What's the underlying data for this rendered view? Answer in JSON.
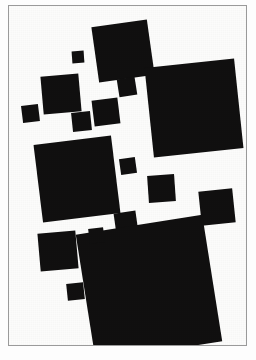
{
  "page": {
    "width": 256,
    "height": 360,
    "background_color": "#ffffff",
    "kind": "artwork-reproduction-plate"
  },
  "frame": {
    "border_color": "#9a9a9a",
    "border_width_px": 1,
    "x": 8,
    "y": 5,
    "width": 239,
    "height": 341,
    "canvas_color": "#fcfcfb"
  },
  "artwork": {
    "title": "",
    "medium_color": "#111010",
    "ground_color": "#fcfcfb",
    "shape_count": 18
  },
  "caption": {
    "mark": ""
  },
  "shapes": [
    {
      "name": "square-top-large",
      "x": 94,
      "y": 22,
      "size": 56,
      "rotate": -8,
      "color": "#111010"
    },
    {
      "name": "square-top-tiny",
      "x": 71,
      "y": 50,
      "size": 12,
      "rotate": -4,
      "color": "#111010"
    },
    {
      "name": "square-right-largest",
      "x": 148,
      "y": 62,
      "size": 90,
      "rotate": -6,
      "color": "#111010"
    },
    {
      "name": "square-upper-left-mid",
      "x": 41,
      "y": 74,
      "size": 38,
      "rotate": -5,
      "color": "#111010"
    },
    {
      "name": "square-upper-center",
      "x": 117,
      "y": 77,
      "size": 18,
      "rotate": -9,
      "color": "#111010"
    },
    {
      "name": "square-center-mid",
      "x": 92,
      "y": 98,
      "size": 26,
      "rotate": -7,
      "color": "#111010"
    },
    {
      "name": "square-center-small",
      "x": 71,
      "y": 111,
      "size": 19,
      "rotate": -6,
      "color": "#111010"
    },
    {
      "name": "square-far-left-small",
      "x": 21,
      "y": 104,
      "size": 17,
      "rotate": -7,
      "color": "#111010"
    },
    {
      "name": "square-left-large",
      "x": 37,
      "y": 139,
      "size": 78,
      "rotate": -7,
      "color": "#111010"
    },
    {
      "name": "square-center-dot",
      "x": 119,
      "y": 157,
      "size": 16,
      "rotate": -8,
      "color": "#111010"
    },
    {
      "name": "square-mid-right",
      "x": 147,
      "y": 174,
      "size": 27,
      "rotate": -4,
      "color": "#111010"
    },
    {
      "name": "square-right-lower",
      "x": 199,
      "y": 189,
      "size": 34,
      "rotate": -6,
      "color": "#111010"
    },
    {
      "name": "square-center-low",
      "x": 114,
      "y": 211,
      "size": 22,
      "rotate": -8,
      "color": "#111010"
    },
    {
      "name": "square-bottom-largest",
      "x": 84,
      "y": 223,
      "size": 128,
      "rotate": -9,
      "color": "#111010"
    },
    {
      "name": "square-left-lower-mid",
      "x": 38,
      "y": 231,
      "size": 38,
      "rotate": -5,
      "color": "#111010"
    },
    {
      "name": "square-lower-tiny",
      "x": 88,
      "y": 227,
      "size": 15,
      "rotate": -7,
      "color": "#111010"
    },
    {
      "name": "square-bottom-left-tiny",
      "x": 66,
      "y": 282,
      "size": 17,
      "rotate": -6,
      "color": "#111010"
    }
  ]
}
